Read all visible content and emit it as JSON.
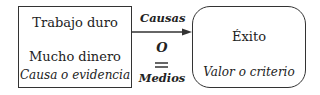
{
  "left_box": {
    "line1": "Trabajo duro",
    "line2": "Mucho dinero",
    "caption": "Causa o evidencia"
  },
  "right_box": {
    "title": "Éxito",
    "caption": "Valor o criterio"
  },
  "connector": {
    "top_label": "Causas",
    "middle_label": "O",
    "bottom_label": "Medios",
    "symbol": "equals"
  }
}
